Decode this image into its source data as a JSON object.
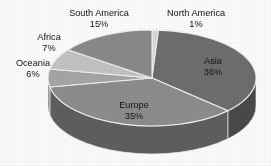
{
  "chart_data": {
    "type": "pie",
    "title": "",
    "subtitle": "",
    "xlabel": "",
    "ylabel": "",
    "legend_position": "none",
    "grid": false,
    "three_d": true,
    "units": "percent",
    "total": "100%",
    "categories": [
      "North America",
      "Asia",
      "Europe",
      "Oceania",
      "Africa",
      "South America"
    ],
    "values": [
      1,
      36,
      35,
      6,
      7,
      15
    ],
    "slices": [
      {
        "label": "North America",
        "value": 1,
        "value_text": "1%",
        "color": "#d8d8d8",
        "side_color": "#9a9a9a",
        "label_x": 196,
        "label_y": 14,
        "value_x": 196,
        "value_y": 25,
        "label_placement": "outside"
      },
      {
        "label": "Asia",
        "value": 36,
        "value_text": "36%",
        "color": "#6e6e6e",
        "side_color": "#4a4a4a",
        "label_x": 213,
        "label_y": 62,
        "value_x": 213,
        "value_y": 73,
        "label_placement": "inside"
      },
      {
        "label": "Europe",
        "value": 35,
        "value_text": "35%",
        "color": "#8d8d8d",
        "side_color": "#5f5f5f",
        "label_x": 134,
        "label_y": 106,
        "value_x": 134,
        "value_y": 117,
        "label_placement": "inside"
      },
      {
        "label": "Oceania",
        "value": 6,
        "value_text": "6%",
        "color": "#a6a6a6",
        "side_color": "#737373",
        "label_x": 33,
        "label_y": 64,
        "value_x": 33,
        "value_y": 75,
        "label_placement": "outside"
      },
      {
        "label": "Africa",
        "value": 7,
        "value_text": "7%",
        "color": "#c4c4c4",
        "side_color": "#8b8b8b",
        "label_x": 49,
        "label_y": 38,
        "value_x": 49,
        "value_y": 49,
        "label_placement": "outside"
      },
      {
        "label": "South America",
        "value": 15,
        "value_text": "15%",
        "color": "#8a8a8a",
        "side_color": "#5c5c5c",
        "label_x": 99,
        "label_y": 14,
        "value_x": 99,
        "value_y": 25,
        "label_placement": "outside"
      }
    ],
    "colors": {
      "background": "#fdfdfd",
      "slice_outline": "#f2f2f2",
      "label_text": "#1b1b1b"
    },
    "geometry": {
      "center_x": 152,
      "center_y": 78,
      "radius_x": 104,
      "radius_y": 48,
      "depth": 28,
      "start_angle_deg": -90,
      "direction": "clockwise"
    }
  }
}
